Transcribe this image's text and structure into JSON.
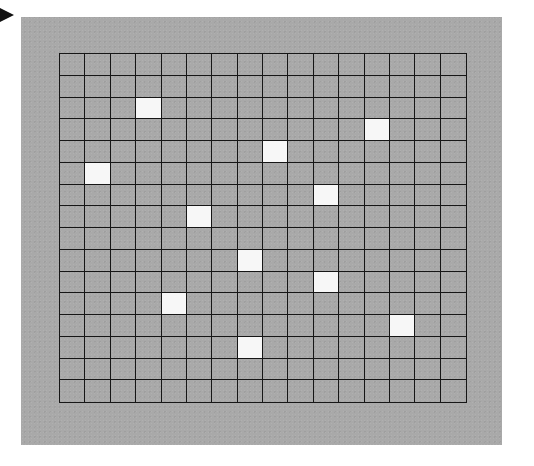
{
  "figure": {
    "pointer": {
      "icon": "arrow-right-icon",
      "color": "#111111"
    },
    "panel": {
      "background_color": "#a9a9a9"
    },
    "grid": {
      "rows": 16,
      "cols": 16,
      "line_color": "#161616",
      "cell_color": "#a9a9a9",
      "lit_color": "#f7f7f7",
      "lit_cells": [
        {
          "row": 2,
          "col": 3
        },
        {
          "row": 3,
          "col": 12
        },
        {
          "row": 4,
          "col": 8
        },
        {
          "row": 5,
          "col": 1
        },
        {
          "row": 6,
          "col": 10
        },
        {
          "row": 7,
          "col": 5
        },
        {
          "row": 9,
          "col": 7
        },
        {
          "row": 10,
          "col": 10
        },
        {
          "row": 11,
          "col": 4
        },
        {
          "row": 12,
          "col": 13
        },
        {
          "row": 13,
          "col": 7
        }
      ],
      "lit_count": "11"
    }
  }
}
